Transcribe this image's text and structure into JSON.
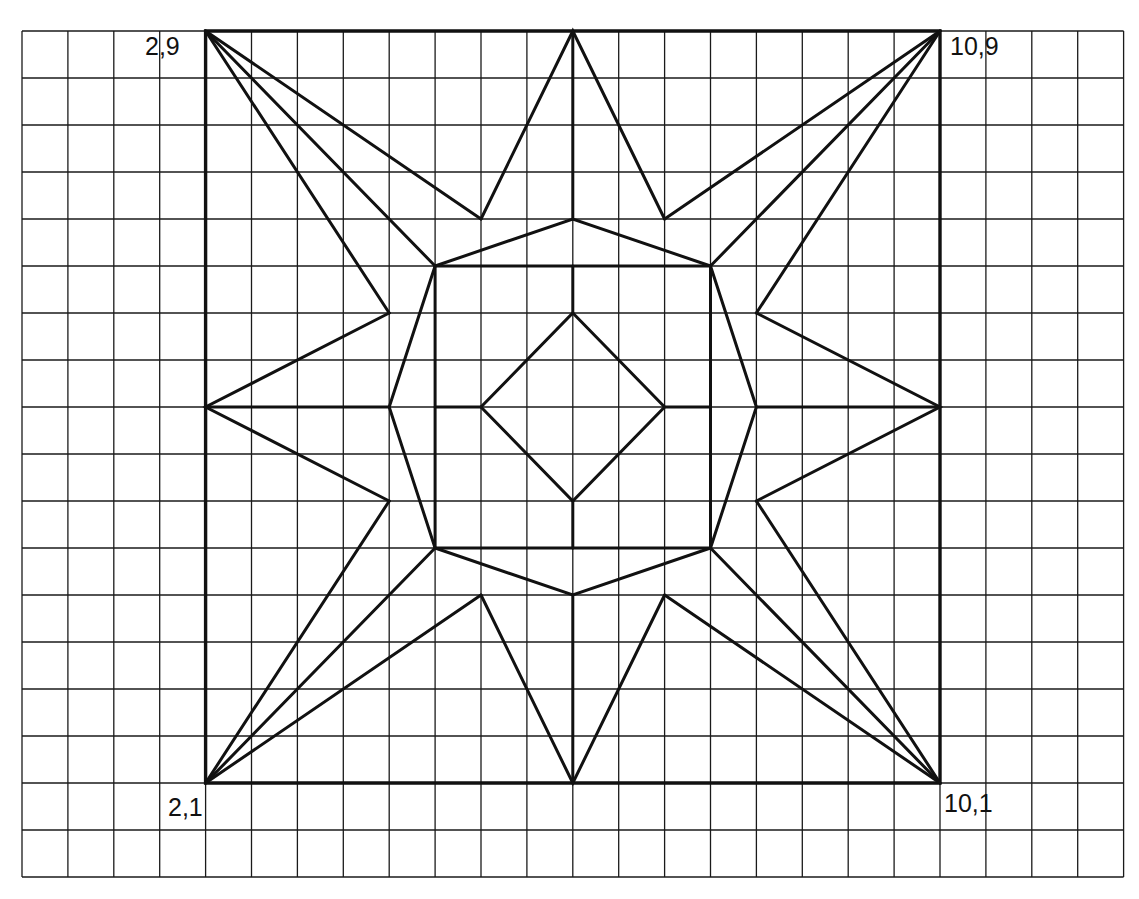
{
  "diagram": {
    "grid": {
      "cols": 24,
      "rows": 18,
      "origin_px": [
        22,
        31
      ],
      "cell_w": 45.9,
      "cell_h": 47.0
    },
    "square_offset_cells": [
      4,
      0
    ],
    "square_size_cells": 16,
    "colors": {
      "line": "#111111",
      "grid": "#1a1a1a",
      "background": "#ffffff"
    },
    "labels": [
      {
        "text": "2,9",
        "anchor": "top-left-corner"
      },
      {
        "text": "10,9",
        "anchor": "top-right-corner"
      },
      {
        "text": "2,1",
        "anchor": "bottom-left-corner"
      },
      {
        "text": "10,1",
        "anchor": "bottom-right-corner"
      }
    ],
    "shapes": {
      "outer_square": [
        [
          0,
          0
        ],
        [
          16,
          0
        ],
        [
          16,
          16
        ],
        [
          0,
          16
        ]
      ],
      "inner_square": [
        [
          5,
          5
        ],
        [
          11,
          5
        ],
        [
          11,
          11
        ],
        [
          5,
          11
        ]
      ],
      "octagon": [
        [
          5,
          5
        ],
        [
          8,
          4
        ],
        [
          11,
          5
        ],
        [
          12,
          8
        ],
        [
          11,
          11
        ],
        [
          8,
          12
        ],
        [
          5,
          11
        ],
        [
          4,
          8
        ]
      ],
      "diamond": [
        [
          8,
          6
        ],
        [
          10,
          8
        ],
        [
          8,
          10
        ],
        [
          6,
          8
        ]
      ],
      "star_points": [
        [
          [
            6,
            4
          ],
          [
            8,
            0
          ],
          [
            10,
            4
          ]
        ],
        [
          [
            12,
            6
          ],
          [
            16,
            8
          ],
          [
            12,
            10
          ]
        ],
        [
          [
            10,
            12
          ],
          [
            8,
            16
          ],
          [
            6,
            12
          ]
        ],
        [
          [
            4,
            10
          ],
          [
            0,
            8
          ],
          [
            4,
            6
          ]
        ]
      ],
      "corner_fans": [
        {
          "corner": [
            0,
            0
          ],
          "targets": [
            [
              6,
              4
            ],
            [
              5,
              5
            ],
            [
              4,
              6
            ]
          ]
        },
        {
          "corner": [
            16,
            0
          ],
          "targets": [
            [
              10,
              4
            ],
            [
              11,
              5
            ],
            [
              12,
              6
            ]
          ]
        },
        {
          "corner": [
            16,
            16
          ],
          "targets": [
            [
              12,
              10
            ],
            [
              11,
              11
            ],
            [
              10,
              12
            ]
          ]
        },
        {
          "corner": [
            0,
            16
          ],
          "targets": [
            [
              4,
              10
            ],
            [
              5,
              11
            ],
            [
              6,
              12
            ]
          ]
        }
      ],
      "axis_segments": [
        [
          [
            0,
            8
          ],
          [
            4,
            8
          ]
        ],
        [
          [
            5,
            8
          ],
          [
            6,
            8
          ]
        ],
        [
          [
            10,
            8
          ],
          [
            11,
            8
          ]
        ],
        [
          [
            12,
            8
          ],
          [
            16,
            8
          ]
        ],
        [
          [
            8,
            0
          ],
          [
            8,
            4
          ]
        ],
        [
          [
            8,
            5
          ],
          [
            8,
            6
          ]
        ],
        [
          [
            8,
            10
          ],
          [
            8,
            11
          ]
        ],
        [
          [
            8,
            12
          ],
          [
            8,
            16
          ]
        ]
      ]
    }
  }
}
